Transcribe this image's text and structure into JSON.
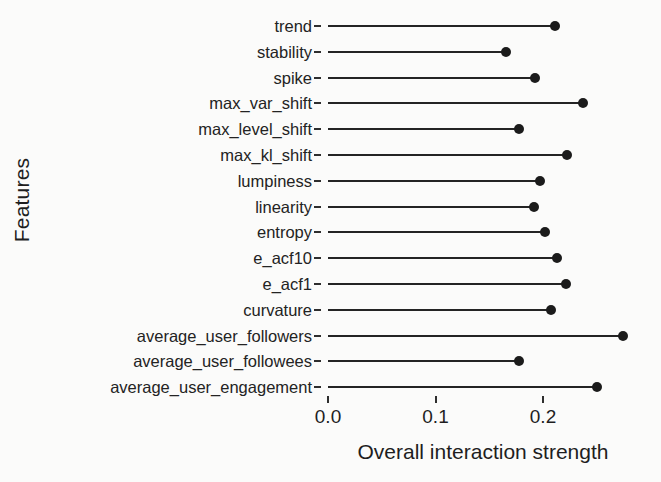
{
  "chart_data": {
    "type": "bar",
    "subtype": "lollipop-horizontal",
    "title": "",
    "xlabel": "Overall interaction strength",
    "ylabel": "Features",
    "xlim": [
      0.0,
      0.288
    ],
    "xticks": [
      0.0,
      0.1,
      0.2
    ],
    "xtick_labels": [
      "0.0",
      "0.1",
      "0.2"
    ],
    "grid": false,
    "legend": null,
    "orientation": "horizontal",
    "marker_color": "#1b1b1b",
    "line_color": "#242424",
    "background_color": "#fbfbfa",
    "categories": [
      "trend",
      "stability",
      "spike",
      "max_var_shift",
      "max_level_shift",
      "max_kl_shift",
      "lumpiness",
      "linearity",
      "entropy",
      "e_acf10",
      "e_acf1",
      "curvature",
      "average_user_followers",
      "average_user_followees",
      "average_user_engagement"
    ],
    "values": [
      0.211,
      0.166,
      0.193,
      0.237,
      0.178,
      0.222,
      0.197,
      0.192,
      0.202,
      0.213,
      0.221,
      0.207,
      0.274,
      0.178,
      0.25
    ]
  }
}
